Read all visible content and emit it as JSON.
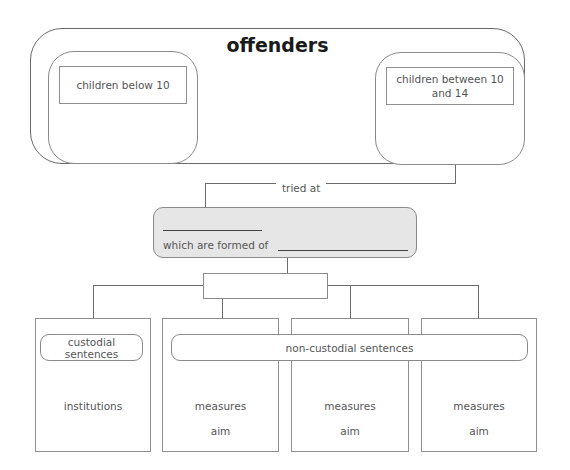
{
  "diagram": {
    "title": "offenders",
    "groups": [
      {
        "label": "children below 10"
      },
      {
        "label": "children between 10 and 14"
      }
    ],
    "connector_label": "tried at",
    "court_box": {
      "blank_top": "",
      "formed_of_label": "which are formed of",
      "blank_bottom": ""
    },
    "sentence_box": {
      "label": ""
    },
    "categories": {
      "custodial": "custodial sentences",
      "non_custodial": "non-custodial sentences"
    },
    "columns": [
      {
        "top": "institutions",
        "bottom": ""
      },
      {
        "top": "measures",
        "bottom": "aim"
      },
      {
        "top": "measures",
        "bottom": "aim"
      },
      {
        "top": "measures",
        "bottom": "aim"
      }
    ]
  },
  "colors": {
    "line": "#6b6b6b",
    "gray_box_fill": "#e6e6e6",
    "text": "#555555",
    "title": "#1a1a1a"
  }
}
